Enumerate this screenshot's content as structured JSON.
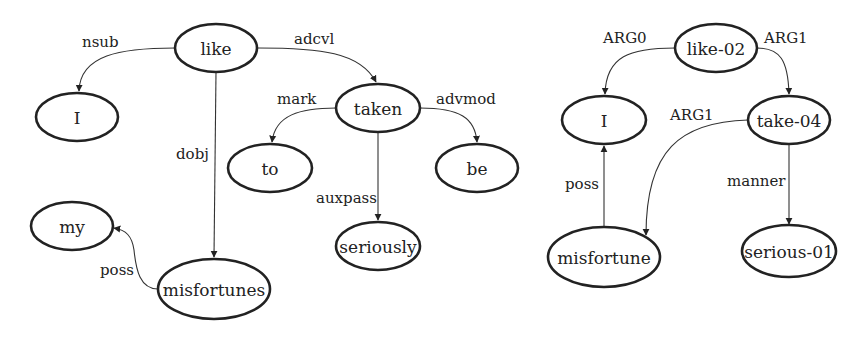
{
  "colors": {
    "stroke": "#222222",
    "edge": "#333333",
    "background": "#ffffff"
  },
  "dependency_graph": {
    "nodes": {
      "like": "like",
      "I": "I",
      "taken": "taken",
      "to": "to",
      "be": "be",
      "seriously": "seriously",
      "my": "my",
      "misfortunes": "misfortunes"
    },
    "edges": {
      "nsub": "nsub",
      "adcvl": "adcvl",
      "mark": "mark",
      "advmod": "advmod",
      "dobj": "dobj",
      "auxpass": "auxpass",
      "poss": "poss"
    }
  },
  "amr_graph": {
    "nodes": {
      "like02": "like-02",
      "I": "I",
      "take04": "take-04",
      "misfortune": "misfortune",
      "serious01": "serious-01"
    },
    "edges": {
      "arg0": "ARG0",
      "arg1_top": "ARG1",
      "arg1_take": "ARG1",
      "poss": "poss",
      "manner": "manner"
    }
  }
}
